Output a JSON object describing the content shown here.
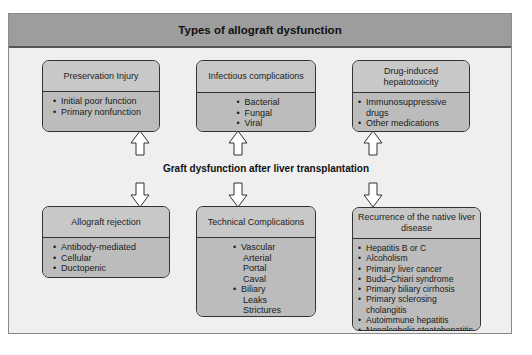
{
  "title": "Types of allograft dysfunction",
  "center_label": "Graft dysfunction after liver transplantation",
  "top_boxes": [
    {
      "title": "Preservation Injury",
      "items": [
        {
          "text": "Initial poor function",
          "level": 1
        },
        {
          "text": "Primary nonfunction",
          "level": 1
        }
      ]
    },
    {
      "title": "Infectious complications",
      "items": [
        {
          "text": "Bacterial",
          "level": 1
        },
        {
          "text": "Fungal",
          "level": 1
        },
        {
          "text": "Viral",
          "level": 1
        }
      ]
    },
    {
      "title": "Drug-induced hepatotoxicity",
      "items": [
        {
          "text": "Immunosuppressive drugs",
          "level": 1
        },
        {
          "text": "Other medications",
          "level": 1
        }
      ]
    }
  ],
  "bottom_boxes": [
    {
      "title": "Allograft rejection",
      "items": [
        {
          "text": "Antibody-mediated",
          "level": 1
        },
        {
          "text": "Cellular",
          "level": 1
        },
        {
          "text": "Ductopenic",
          "level": 1
        }
      ]
    },
    {
      "title": "Technical Complications",
      "items": [
        {
          "text": "Vascular",
          "level": 1
        },
        {
          "text": "Arterial",
          "level": 2
        },
        {
          "text": "Portal",
          "level": 2
        },
        {
          "text": "Caval",
          "level": 2
        },
        {
          "text": "Biliary",
          "level": 1
        },
        {
          "text": "Leaks",
          "level": 2
        },
        {
          "text": "Strictures",
          "level": 2
        }
      ]
    },
    {
      "title": "Recurrence of the native liver disease",
      "items": [
        {
          "text": "Hepatitis B or C",
          "level": 1
        },
        {
          "text": "Alcoholism",
          "level": 1
        },
        {
          "text": "Primary liver cancer",
          "level": 1
        },
        {
          "text": "Budd–Chiari syndrome",
          "level": 1
        },
        {
          "text": "Primary biliary cirrhosis",
          "level": 1
        },
        {
          "text": "Primary sclerosing cholangitis",
          "level": 1
        },
        {
          "text": "Autoimmune hepatitis",
          "level": 1
        },
        {
          "text": "Nonalcoholic steatohepatitis",
          "level": 1
        }
      ]
    }
  ],
  "arrows": {
    "top_row_direction": "up",
    "bottom_row_direction": "down",
    "icon": "hollow-block-arrow-icon"
  },
  "colors": {
    "header_bg": "#9d9d9d",
    "panel_bg": "#efefef",
    "box_head_bg": "#c8c8c8",
    "box_body_bg": "#bcbcbc",
    "border": "#333333"
  }
}
